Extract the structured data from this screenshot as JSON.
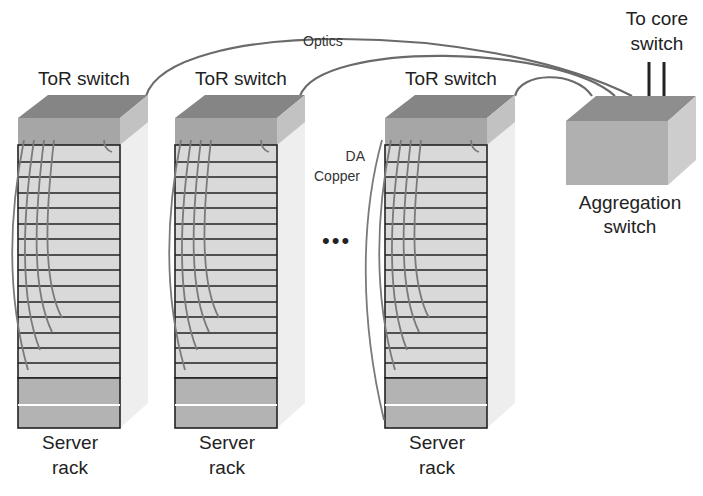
{
  "diagram": {
    "type": "data-center-network-topology",
    "labels": {
      "tor_switch": "ToR switch",
      "optics": "Optics",
      "da_copper_line1": "DA",
      "da_copper_line2": "Copper",
      "to_core_line1": "To core",
      "to_core_line2": "switch",
      "aggregation_line1": "Aggregation",
      "aggregation_line2": "switch",
      "server_line1": "Server",
      "server_line2": "rack",
      "ellipsis": "•••"
    },
    "racks": [
      {
        "id": "rack-1",
        "tor_label": "ToR switch",
        "server_label": [
          "Server",
          "rack"
        ]
      },
      {
        "id": "rack-2",
        "tor_label": "ToR switch",
        "server_label": [
          "Server",
          "rack"
        ]
      },
      {
        "id": "rack-3",
        "tor_label": "ToR switch",
        "server_label": [
          "Server",
          "rack"
        ]
      }
    ],
    "server_slots_per_rack": 15,
    "colors": {
      "switch_top": "#8a8a8a",
      "switch_front": "#a8a8a8",
      "switch_side": "#c4c4c4",
      "rack_fill": "#d9d9d9",
      "rack_side": "#ececec",
      "rack_bottom": "#b0b0b0",
      "cable": "#6e6e6e",
      "line": "#222222"
    }
  }
}
